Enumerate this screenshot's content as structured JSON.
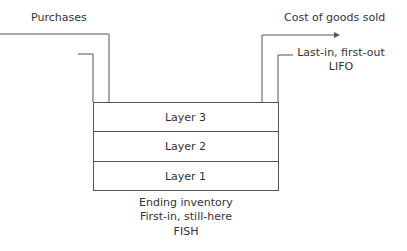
{
  "labels": {
    "purchases": "Purchases",
    "cogs": "Cost of goods sold",
    "lifo_line1": "Last-in, first-out",
    "lifo_line2": "LIFO",
    "ending_line1": "Ending inventory",
    "ending_line2": "First-in, still-here",
    "ending_line3": "FISH"
  },
  "layers": [
    {
      "label": "Layer 3"
    },
    {
      "label": "Layer 2"
    },
    {
      "label": "Layer 1"
    }
  ],
  "colors": {
    "line": "#555555",
    "text": "#333333"
  }
}
